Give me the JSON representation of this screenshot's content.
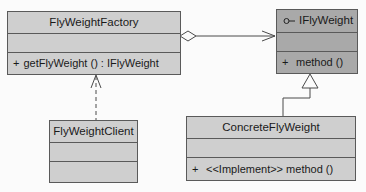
{
  "diagram": {
    "type": "UML class diagram",
    "pattern": "Flyweight",
    "colors": {
      "class_fill": "#cfcfcf",
      "interface_fill": "#a9a9a9",
      "border": "#5a5a5a",
      "background": "#fbfbfb"
    },
    "classes": {
      "factory": {
        "name": "FlyWeightFactory",
        "attributes": [],
        "operations": [
          {
            "visibility": "+",
            "signature": "getFlyWeight () : IFlyWeight"
          }
        ]
      },
      "interface": {
        "name": "IFlyWeight",
        "stereotype_icon": "interface-lollipop-icon",
        "attributes": [],
        "operations": [
          {
            "visibility": "+",
            "signature": "method ()"
          }
        ]
      },
      "client": {
        "name": "FlyWeightClient",
        "attributes": [],
        "operations": []
      },
      "concrete": {
        "name": "ConcreteFlyWeight",
        "attributes": [],
        "operations": [
          {
            "visibility": "+",
            "signature": "<<Implement>> method ()"
          }
        ]
      }
    },
    "relationships": [
      {
        "type": "aggregation",
        "from": "FlyWeightFactory",
        "to": "IFlyWeight"
      },
      {
        "type": "dependency",
        "from": "FlyWeightClient",
        "to": "FlyWeightFactory"
      },
      {
        "type": "generalization",
        "from": "ConcreteFlyWeight",
        "to": "IFlyWeight"
      }
    ]
  }
}
